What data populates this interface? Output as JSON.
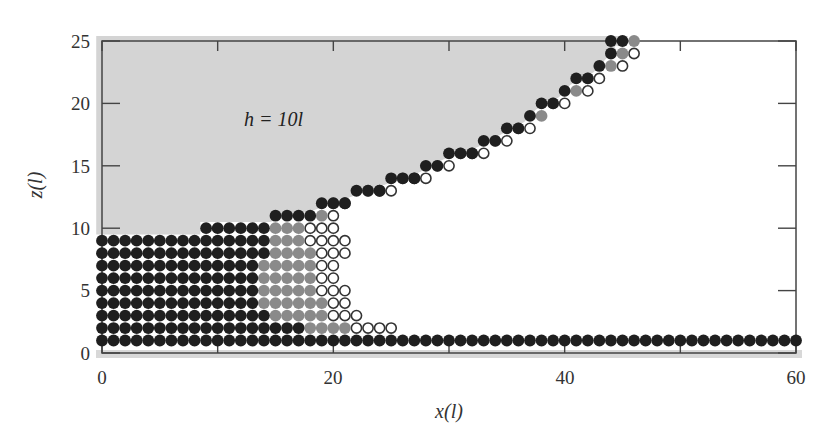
{
  "chart_data": {
    "type": "scatter",
    "title": "",
    "xlabel": "x(l)",
    "ylabel": "z(l)",
    "xlim": [
      0,
      60
    ],
    "ylim": [
      0,
      25
    ],
    "xticks": [
      0,
      20,
      40,
      60
    ],
    "yticks": [
      0,
      5,
      10,
      15,
      20,
      25
    ],
    "x_minor_ticks": [
      10,
      30,
      50
    ],
    "annotation": "h = 10l",
    "shaded_region": "grey region above the bead surface (fluid of height h)",
    "grid": false,
    "legend": null,
    "series": [
      {
        "name": "black beads",
        "color": "#1f1f1f",
        "style": "filled"
      },
      {
        "name": "grey beads",
        "color": "#8a8a8a",
        "style": "filled"
      },
      {
        "name": "open beads",
        "color": "#ffffff",
        "style": "hollow"
      }
    ],
    "rows": [
      {
        "z": 1,
        "segments": [
          [
            "black",
            0,
            60
          ]
        ]
      },
      {
        "z": 2,
        "segments": [
          [
            "black",
            0,
            17
          ],
          [
            "grey",
            18,
            21
          ],
          [
            "open",
            22,
            25
          ]
        ]
      },
      {
        "z": 3,
        "segments": [
          [
            "black",
            0,
            14
          ],
          [
            "grey",
            15,
            19
          ],
          [
            "open",
            20,
            22
          ]
        ]
      },
      {
        "z": 4,
        "segments": [
          [
            "black",
            0,
            13
          ],
          [
            "grey",
            14,
            19
          ],
          [
            "open",
            20,
            21
          ]
        ]
      },
      {
        "z": 5,
        "segments": [
          [
            "black",
            0,
            13
          ],
          [
            "grey",
            14,
            18
          ],
          [
            "open",
            19,
            21
          ]
        ]
      },
      {
        "z": 6,
        "segments": [
          [
            "black",
            0,
            13
          ],
          [
            "grey",
            14,
            18
          ],
          [
            "open",
            19,
            20
          ]
        ]
      },
      {
        "z": 7,
        "segments": [
          [
            "black",
            0,
            13
          ],
          [
            "grey",
            14,
            18
          ],
          [
            "open",
            19,
            20
          ]
        ]
      },
      {
        "z": 8,
        "segments": [
          [
            "black",
            0,
            14
          ],
          [
            "grey",
            15,
            18
          ],
          [
            "open",
            19,
            21
          ]
        ]
      },
      {
        "z": 9,
        "segments": [
          [
            "black",
            0,
            14
          ],
          [
            "grey",
            15,
            17
          ],
          [
            "open",
            18,
            21
          ]
        ]
      },
      {
        "z": 10,
        "segments": [
          [
            "black",
            9,
            14
          ],
          [
            "grey",
            15,
            17
          ],
          [
            "open",
            18,
            20
          ]
        ]
      },
      {
        "z": 11,
        "segments": [
          [
            "black",
            15,
            18
          ],
          [
            "grey",
            19,
            19
          ],
          [
            "open",
            20,
            20
          ]
        ]
      },
      {
        "z": 12,
        "segments": [
          [
            "black",
            19,
            21
          ],
          [
            "grey",
            20,
            20
          ],
          [
            "open",
            21,
            21
          ]
        ]
      },
      {
        "z": 13,
        "segments": [
          [
            "black",
            22,
            24
          ],
          [
            "grey",
            23,
            23
          ],
          [
            "open",
            24,
            25
          ]
        ]
      },
      {
        "z": 14,
        "segments": [
          [
            "black",
            25,
            27
          ],
          [
            "grey",
            26,
            26
          ],
          [
            "open",
            27,
            28
          ]
        ]
      },
      {
        "z": 15,
        "segments": [
          [
            "black",
            28,
            29
          ],
          [
            "grey",
            29,
            29
          ],
          [
            "open",
            30,
            30
          ]
        ]
      },
      {
        "z": 16,
        "segments": [
          [
            "black",
            30,
            32
          ],
          [
            "grey",
            31,
            31
          ],
          [
            "open",
            32,
            33
          ]
        ]
      },
      {
        "z": 17,
        "segments": [
          [
            "black",
            33,
            34
          ],
          [
            "grey",
            34,
            34
          ],
          [
            "open",
            35,
            35
          ]
        ]
      },
      {
        "z": 18,
        "segments": [
          [
            "black",
            35,
            36
          ],
          [
            "grey",
            36,
            36
          ],
          [
            "open",
            37,
            37
          ]
        ]
      },
      {
        "z": 19,
        "segments": [
          [
            "black",
            37,
            37
          ],
          [
            "grey",
            38,
            38
          ]
        ]
      },
      {
        "z": 20,
        "segments": [
          [
            "black",
            38,
            39
          ],
          [
            "grey",
            39,
            39
          ],
          [
            "open",
            40,
            40
          ]
        ]
      },
      {
        "z": 21,
        "segments": [
          [
            "black",
            40,
            40
          ],
          [
            "grey",
            41,
            41
          ],
          [
            "open",
            42,
            42
          ]
        ]
      },
      {
        "z": 22,
        "segments": [
          [
            "black",
            41,
            42
          ],
          [
            "grey",
            42,
            42
          ],
          [
            "open",
            43,
            43
          ]
        ]
      },
      {
        "z": 23,
        "segments": [
          [
            "black",
            43,
            43
          ],
          [
            "grey",
            44,
            44
          ],
          [
            "open",
            45,
            45
          ]
        ]
      },
      {
        "z": 24,
        "segments": [
          [
            "black",
            44,
            44
          ],
          [
            "grey",
            45,
            45
          ],
          [
            "open",
            46,
            46
          ]
        ]
      },
      {
        "z": 25,
        "segments": [
          [
            "black",
            44,
            45
          ],
          [
            "grey",
            46,
            46
          ]
        ]
      }
    ]
  },
  "labels": {
    "xlabel": "x(l)",
    "ylabel": "z(l)",
    "annotation": "h = 10l",
    "xtick_0": "0",
    "xtick_20": "20",
    "xtick_40": "40",
    "xtick_60": "60",
    "ytick_0": "0",
    "ytick_5": "5",
    "ytick_10": "10",
    "ytick_15": "15",
    "ytick_20": "20",
    "ytick_25": "25"
  },
  "colors": {
    "shade": "#d4d4d4",
    "black_bead": "#1f1f1f",
    "grey_bead": "#8a8a8a",
    "open_bead_stroke": "#333333",
    "axis": "#444444"
  }
}
